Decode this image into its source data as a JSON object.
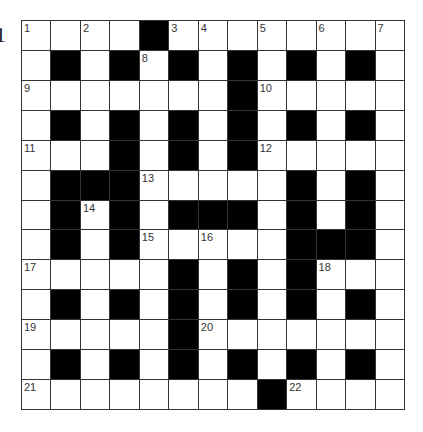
{
  "edge_label": "1",
  "crossword": {
    "rows": 13,
    "cols": 13,
    "colors": {
      "black": "#000000",
      "white": "#ffffff",
      "line": "#333333"
    },
    "grid": [
      "....#........",
      ".#.#.#.#.#.#.",
      ".......#.....",
      ".#.#.#.#.#.#.",
      "...#.#.#.....",
      ".###.....#.#.",
      ".#.#.###.#.#.",
      ".#.#.....###.",
      ".....#.#.#...",
      ".#.#.#.#.#.#.",
      ".....#.......",
      ".#.#.#.#.#.#.",
      "........#...."
    ],
    "numbers": [
      {
        "r": 0,
        "c": 0,
        "n": "1"
      },
      {
        "r": 0,
        "c": 2,
        "n": "2"
      },
      {
        "r": 0,
        "c": 5,
        "n": "3"
      },
      {
        "r": 0,
        "c": 6,
        "n": "4"
      },
      {
        "r": 0,
        "c": 8,
        "n": "5"
      },
      {
        "r": 0,
        "c": 10,
        "n": "6"
      },
      {
        "r": 0,
        "c": 12,
        "n": "7"
      },
      {
        "r": 1,
        "c": 4,
        "n": "8"
      },
      {
        "r": 2,
        "c": 0,
        "n": "9"
      },
      {
        "r": 2,
        "c": 8,
        "n": "10"
      },
      {
        "r": 4,
        "c": 0,
        "n": "11"
      },
      {
        "r": 4,
        "c": 8,
        "n": "12"
      },
      {
        "r": 5,
        "c": 4,
        "n": "13"
      },
      {
        "r": 6,
        "c": 2,
        "n": "14"
      },
      {
        "r": 7,
        "c": 4,
        "n": "15"
      },
      {
        "r": 7,
        "c": 6,
        "n": "16"
      },
      {
        "r": 8,
        "c": 0,
        "n": "17"
      },
      {
        "r": 8,
        "c": 10,
        "n": "18"
      },
      {
        "r": 10,
        "c": 0,
        "n": "19"
      },
      {
        "r": 10,
        "c": 6,
        "n": "20"
      },
      {
        "r": 12,
        "c": 0,
        "n": "21"
      },
      {
        "r": 12,
        "c": 9,
        "n": "22"
      }
    ]
  }
}
